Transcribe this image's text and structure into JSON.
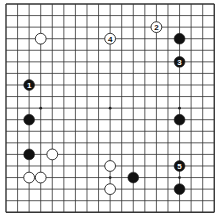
{
  "board": {
    "size": 19,
    "origin_x": 6,
    "origin_y": 4,
    "spacing": 11.57,
    "stone_radius": 5.4,
    "line_color": "#333333",
    "background": "#ffffff",
    "star_points": [
      [
        3,
        3
      ],
      [
        9,
        3
      ],
      [
        15,
        3
      ],
      [
        3,
        9
      ],
      [
        9,
        9
      ],
      [
        15,
        9
      ],
      [
        3,
        15
      ],
      [
        9,
        15
      ],
      [
        15,
        15
      ]
    ]
  },
  "stones": [
    {
      "color": "white",
      "col": 3,
      "row": 3,
      "label": ""
    },
    {
      "color": "white",
      "col": 9,
      "row": 3,
      "label": "4"
    },
    {
      "color": "white",
      "col": 13,
      "row": 2,
      "label": "2"
    },
    {
      "color": "black",
      "col": 15,
      "row": 3,
      "label": ""
    },
    {
      "color": "black",
      "col": 15,
      "row": 5,
      "label": "3"
    },
    {
      "color": "black",
      "col": 2,
      "row": 7,
      "label": "1"
    },
    {
      "color": "black",
      "col": 2,
      "row": 10,
      "label": ""
    },
    {
      "color": "black",
      "col": 15,
      "row": 10,
      "label": ""
    },
    {
      "color": "black",
      "col": 2,
      "row": 13,
      "label": ""
    },
    {
      "color": "white",
      "col": 4,
      "row": 13,
      "label": ""
    },
    {
      "color": "white",
      "col": 2,
      "row": 15,
      "label": ""
    },
    {
      "color": "white",
      "col": 3,
      "row": 15,
      "label": ""
    },
    {
      "color": "white",
      "col": 9,
      "row": 14,
      "label": ""
    },
    {
      "color": "white",
      "col": 9,
      "row": 16,
      "label": ""
    },
    {
      "color": "black",
      "col": 11,
      "row": 15,
      "label": ""
    },
    {
      "color": "black",
      "col": 15,
      "row": 14,
      "label": "5"
    },
    {
      "color": "black",
      "col": 15,
      "row": 16,
      "label": ""
    }
  ]
}
